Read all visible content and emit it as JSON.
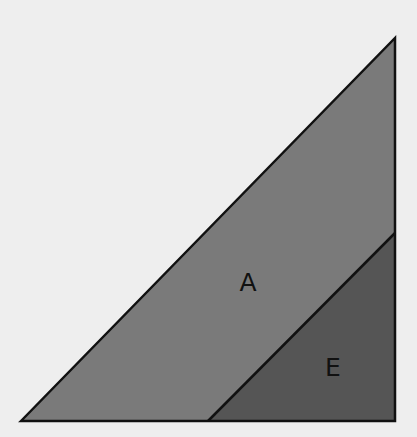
{
  "diagram": {
    "title": "",
    "background": "#eeeeee",
    "stroke": "#111111",
    "regions": [
      {
        "id": "A",
        "label": "A",
        "color": "#7a7a7a",
        "shape": "trapezoid",
        "points": [
          [
            21,
            421
          ],
          [
            395,
            38
          ],
          [
            395,
            233
          ],
          [
            208,
            421
          ]
        ],
        "label_pos": [
          248,
          282
        ]
      },
      {
        "id": "E",
        "label": "E",
        "color": "#555555",
        "shape": "triangle",
        "points": [
          [
            208,
            421
          ],
          [
            395,
            233
          ],
          [
            395,
            421
          ]
        ],
        "label_pos": [
          333,
          367
        ]
      }
    ],
    "outer_triangle": [
      [
        21,
        421
      ],
      [
        395,
        38
      ],
      [
        395,
        421
      ]
    ],
    "dividing_line": [
      [
        208,
        421
      ],
      [
        395,
        233
      ]
    ]
  }
}
